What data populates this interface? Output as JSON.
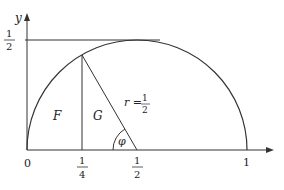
{
  "diagram": {
    "type": "semicircle-geometry",
    "axes": {
      "x_label": "",
      "y_label": "y",
      "x_ticks": [
        {
          "value": 0,
          "label_num": "0"
        },
        {
          "value": 0.25,
          "label_num": "1",
          "label_den": "4"
        },
        {
          "value": 0.5,
          "label_num": "1",
          "label_den": "2"
        },
        {
          "value": 1,
          "label_num": "1"
        }
      ],
      "y_ticks": [
        {
          "value": 0.5,
          "label_num": "1",
          "label_den": "2"
        }
      ]
    },
    "semicircle": {
      "center_x": 0.5,
      "center_y": 0,
      "radius": 0.5
    },
    "radius_label": {
      "lhs": "r =",
      "num": "1",
      "den": "2"
    },
    "regions": {
      "left": "F",
      "right": "G"
    },
    "angle_label": "φ",
    "stroke_color": "#333333"
  }
}
